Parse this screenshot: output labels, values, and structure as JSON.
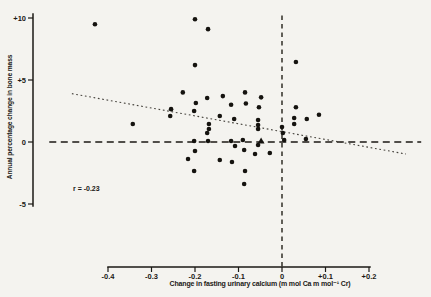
{
  "figure": {
    "background_color": "#f4f3ef",
    "ink_color": "#1b1915",
    "annotation": "r = -0.23"
  },
  "chart_data": {
    "type": "scatter",
    "title": "",
    "xlabel": "Change in fasting urinary calcium (m mol Ca m mol⁻¹ Cr)",
    "ylabel": "Annual percentage change in bone mass",
    "annotation": "r = -0.23",
    "xlim": [
      -0.4,
      0.2
    ],
    "ylim": [
      -5,
      10
    ],
    "grid": false,
    "legend": "none",
    "x_ticks": [
      {
        "value": -0.4,
        "label": "-0.4"
      },
      {
        "value": -0.3,
        "label": "-0.3"
      },
      {
        "value": -0.2,
        "label": "-0.2"
      },
      {
        "value": -0.1,
        "label": "-0.1"
      },
      {
        "value": 0,
        "label": "0"
      },
      {
        "value": 0.1,
        "label": "+0.1"
      },
      {
        "value": 0.2,
        "label": "+0.2"
      }
    ],
    "y_ticks": [
      {
        "value": 10,
        "label": "+10"
      },
      {
        "value": 5,
        "label": "+5"
      },
      {
        "value": 0,
        "label": "0"
      },
      {
        "value": -5,
        "label": "-5"
      }
    ],
    "reference_lines": {
      "horizontal_zero": {
        "y": 0,
        "x_start": -0.535,
        "x_end": 0.32,
        "style": "dashed"
      },
      "vertical_zero": {
        "x": 0,
        "y_start": 10.2,
        "y_end": -10.1,
        "style": "dashed"
      }
    },
    "trend_line": {
      "x1": -0.483,
      "y1": 3.9,
      "x2": 0.285,
      "y2": -0.97,
      "style": "dotted",
      "correlation_r": -0.23
    },
    "mean_marker": {
      "shape": "triangle",
      "x": -0.048,
      "y": 0.08
    },
    "points": [
      [
        -0.43,
        9.5
      ],
      [
        -0.2,
        9.9
      ],
      [
        -0.17,
        9.1
      ],
      [
        -0.2,
        6.2
      ],
      [
        0.032,
        6.45
      ],
      [
        -0.228,
        4.0
      ],
      [
        -0.085,
        4.0
      ],
      [
        -0.136,
        3.7
      ],
      [
        -0.172,
        3.55
      ],
      [
        -0.048,
        3.6
      ],
      [
        -0.117,
        3.0
      ],
      [
        -0.083,
        3.1
      ],
      [
        -0.053,
        2.8
      ],
      [
        0.032,
        2.8
      ],
      [
        -0.255,
        2.65
      ],
      [
        -0.257,
        2.1
      ],
      [
        -0.198,
        3.15
      ],
      [
        -0.202,
        2.5
      ],
      [
        -0.143,
        2.1
      ],
      [
        -0.11,
        1.85
      ],
      [
        -0.343,
        1.45
      ],
      [
        -0.168,
        1.45
      ],
      [
        -0.168,
        1.05
      ],
      [
        -0.055,
        1.77
      ],
      [
        -0.055,
        1.37
      ],
      [
        -0.055,
        1.05
      ],
      [
        0.028,
        1.94
      ],
      [
        0.028,
        1.45
      ],
      [
        0.057,
        1.85
      ],
      [
        0.085,
        2.2
      ],
      [
        0.0,
        1.2
      ],
      [
        0.002,
        0.73
      ],
      [
        -0.172,
        0.73
      ],
      [
        -0.202,
        0.08
      ],
      [
        -0.17,
        0.08
      ],
      [
        -0.117,
        0.08
      ],
      [
        -0.09,
        0.16
      ],
      [
        0.005,
        0.16
      ],
      [
        0.055,
        0.24
      ],
      [
        -0.108,
        -0.32
      ],
      [
        -0.087,
        -0.65
      ],
      [
        -0.055,
        -0.24
      ],
      [
        -0.062,
        -0.97
      ],
      [
        -0.028,
        -0.89
      ],
      [
        -0.2,
        -0.73
      ],
      [
        -0.216,
        -1.37
      ],
      [
        -0.143,
        -1.45
      ],
      [
        -0.115,
        -1.61
      ],
      [
        -0.202,
        -2.34
      ],
      [
        -0.085,
        -2.34
      ],
      [
        -0.087,
        -3.39
      ]
    ]
  }
}
